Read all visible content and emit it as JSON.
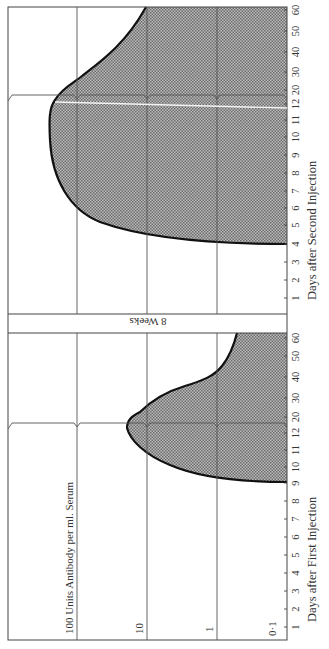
{
  "chart_data": [
    {
      "type": "area",
      "title": "Antibody response after first injection",
      "xlabel": "Days after First Injection",
      "ylabel": "Units Antibody per ml. Serum",
      "y_scale": "log",
      "ylim": [
        0.1,
        100
      ],
      "y_ticks": [
        "0·1",
        "1",
        "10",
        "100"
      ],
      "x_ticks": [
        "1",
        "2",
        "3",
        "4",
        "5",
        "6",
        "7",
        "8",
        "9",
        "10",
        "11",
        "12",
        "20",
        "30",
        "40",
        "50",
        "60"
      ],
      "x": [
        9,
        10,
        11,
        12,
        20,
        30,
        40,
        50,
        60
      ],
      "values": [
        0.1,
        0.2,
        1.5,
        3,
        2,
        0.8,
        0.35,
        0.25,
        0.2
      ],
      "orientation": "rotated 90° counter-clockwise",
      "grid": true
    },
    {
      "type": "area",
      "title": "Antibody response after second injection",
      "xlabel": "Days after Second Injection",
      "ylabel": "Units Antibody per ml. Serum",
      "y_scale": "log",
      "ylim": [
        0.1,
        100
      ],
      "y_ticks": [
        "0·1",
        "1",
        "10",
        "100"
      ],
      "x_ticks": [
        "1",
        "2",
        "3",
        "4",
        "5",
        "6",
        "7",
        "8",
        "9",
        "10",
        "11",
        "12",
        "20",
        "30",
        "40",
        "50",
        "60"
      ],
      "x": [
        4,
        5,
        6,
        7,
        8,
        9,
        10,
        11,
        12,
        20,
        30,
        40,
        50,
        60
      ],
      "values": [
        0.1,
        0.6,
        3,
        12,
        25,
        35,
        40,
        45,
        50,
        20,
        10,
        4,
        2,
        1
      ],
      "orientation": "rotated 90° counter-clockwise",
      "grid": true
    }
  ],
  "labels": {
    "yaxis_title": "100 Units Antibody per ml. Serum",
    "y10": "10",
    "y1": "1",
    "y01": "0·1",
    "gap_label": "8 Weeks",
    "x_title_first": "Days after First Injection",
    "x_title_second": "Days after Second Injection"
  },
  "ticks_upper": [
    {
      "label": "60",
      "y": 10
    },
    {
      "label": "50",
      "y": 31
    },
    {
      "label": "40",
      "y": 52
    },
    {
      "label": "30",
      "y": 72
    },
    {
      "label": "20",
      "y": 90
    },
    {
      "label": "12",
      "y": 104
    },
    {
      "label": "11",
      "y": 120
    },
    {
      "label": "10",
      "y": 137
    },
    {
      "label": "9",
      "y": 155
    },
    {
      "label": "8",
      "y": 173
    },
    {
      "label": "7",
      "y": 191
    },
    {
      "label": "6",
      "y": 208
    },
    {
      "label": "5",
      "y": 225
    },
    {
      "label": "4",
      "y": 244
    },
    {
      "label": "3",
      "y": 262
    },
    {
      "label": "2",
      "y": 280
    },
    {
      "label": "1",
      "y": 298
    }
  ],
  "ticks_lower": [
    {
      "label": "60",
      "y": 338
    },
    {
      "label": "50",
      "y": 356
    },
    {
      "label": "40",
      "y": 377
    },
    {
      "label": "30",
      "y": 398
    },
    {
      "label": "20",
      "y": 417
    },
    {
      "label": "12",
      "y": 433
    },
    {
      "label": "11",
      "y": 450
    },
    {
      "label": "10",
      "y": 467
    },
    {
      "label": "9",
      "y": 483
    },
    {
      "label": "8",
      "y": 501
    },
    {
      "label": "7",
      "y": 519
    },
    {
      "label": "6",
      "y": 537
    },
    {
      "label": "5",
      "y": 555
    },
    {
      "label": "4",
      "y": 573
    },
    {
      "label": "3",
      "y": 591
    },
    {
      "label": "2",
      "y": 609
    },
    {
      "label": "1",
      "y": 627
    }
  ],
  "colors": {
    "frame": "#444444",
    "grid": "#555555",
    "curve": "#111111",
    "fill": "#9a9a9a"
  }
}
